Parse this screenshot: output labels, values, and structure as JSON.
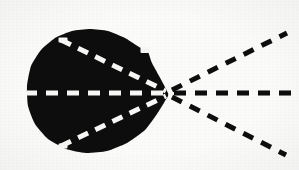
{
  "figure": {
    "caption": "",
    "background_color": "#fbfbfa",
    "ink_color": "#0a0a0a",
    "knockout_color": "#f7f7f5",
    "canvas": {
      "width": 299,
      "height": 170
    }
  },
  "chart_data": {
    "type": "scatter",
    "xlabel": "",
    "ylabel": "",
    "xlim": [
      0,
      299
    ],
    "ylim": [
      0,
      170
    ],
    "grid": false,
    "legend": "none",
    "annotations": [
      "Vertical solid rule at left margin",
      "Solid black lobe occupying left-centre of frame",
      "Apex / convergence node at right tip of lobe",
      "Three dashed rays fan right from the apex",
      "Three mirrored dashed rays are knocked out in white inside the lobe"
    ],
    "focus_point": {
      "name": "apex",
      "x": 168,
      "y": 93
    },
    "series": [
      {
        "name": "margin-rule",
        "kind": "solid-line",
        "color": "#0a0a0a",
        "width": 3,
        "points": [
          {
            "x": 14,
            "y": 0
          },
          {
            "x": 14,
            "y": 170
          }
        ]
      },
      {
        "name": "lobe-outline",
        "kind": "filled-region",
        "color": "#0a0a0a",
        "bounds": {
          "left": 27,
          "top": 29,
          "right": 172,
          "bottom": 153
        },
        "points": [
          {
            "x": 168,
            "y": 93
          },
          {
            "x": 152,
            "y": 63
          },
          {
            "x": 148,
            "y": 52
          },
          {
            "x": 139,
            "y": 47
          },
          {
            "x": 125,
            "y": 38
          },
          {
            "x": 108,
            "y": 31
          },
          {
            "x": 90,
            "y": 29
          },
          {
            "x": 72,
            "y": 31
          },
          {
            "x": 55,
            "y": 38
          },
          {
            "x": 41,
            "y": 50
          },
          {
            "x": 31,
            "y": 66
          },
          {
            "x": 27,
            "y": 86
          },
          {
            "x": 28,
            "y": 106
          },
          {
            "x": 35,
            "y": 124
          },
          {
            "x": 48,
            "y": 139
          },
          {
            "x": 66,
            "y": 149
          },
          {
            "x": 86,
            "y": 153
          },
          {
            "x": 107,
            "y": 151
          },
          {
            "x": 127,
            "y": 143
          },
          {
            "x": 145,
            "y": 130
          },
          {
            "x": 157,
            "y": 114
          },
          {
            "x": 165,
            "y": 101
          }
        ]
      },
      {
        "name": "ray-outer-upper",
        "kind": "dashed-line",
        "color": "#0a0a0a",
        "width": 5,
        "dash": [
          11,
          9
        ],
        "points": [
          {
            "x": 172,
            "y": 90
          },
          {
            "x": 287,
            "y": 33
          }
        ]
      },
      {
        "name": "ray-outer-axis",
        "kind": "dashed-line",
        "color": "#0a0a0a",
        "width": 5,
        "dash": [
          12,
          9
        ],
        "points": [
          {
            "x": 174,
            "y": 93
          },
          {
            "x": 299,
            "y": 93
          }
        ]
      },
      {
        "name": "ray-outer-lower",
        "kind": "dashed-line",
        "color": "#0a0a0a",
        "width": 5,
        "dash": [
          11,
          9
        ],
        "points": [
          {
            "x": 172,
            "y": 97
          },
          {
            "x": 286,
            "y": 155
          }
        ]
      },
      {
        "name": "ray-inner-upper",
        "kind": "dashed-line",
        "color": "#f7f7f5",
        "width": 5,
        "dash": [
          11,
          8
        ],
        "points": [
          {
            "x": 61,
            "y": 40
          },
          {
            "x": 166,
            "y": 91
          }
        ]
      },
      {
        "name": "ray-inner-axis",
        "kind": "dashed-line",
        "color": "#f7f7f5",
        "width": 5,
        "dash": [
          12,
          9
        ],
        "points": [
          {
            "x": 25,
            "y": 93
          },
          {
            "x": 167,
            "y": 93
          }
        ]
      },
      {
        "name": "ray-inner-lower",
        "kind": "dashed-line",
        "color": "#f7f7f5",
        "width": 5,
        "dash": [
          11,
          8
        ],
        "points": [
          {
            "x": 61,
            "y": 146
          },
          {
            "x": 166,
            "y": 96
          }
        ]
      },
      {
        "name": "notch-upper-right",
        "kind": "knockout-mark",
        "color": "#f7f7f5",
        "points": [
          {
            "x": 145,
            "y": 50
          }
        ]
      },
      {
        "name": "notch-lower-left",
        "kind": "knockout-mark",
        "color": "#f7f7f5",
        "points": [
          {
            "x": 63,
            "y": 146
          }
        ]
      },
      {
        "name": "notch-upper-left",
        "kind": "knockout-mark",
        "color": "#f7f7f5",
        "points": [
          {
            "x": 63,
            "y": 40
          }
        ]
      }
    ]
  }
}
